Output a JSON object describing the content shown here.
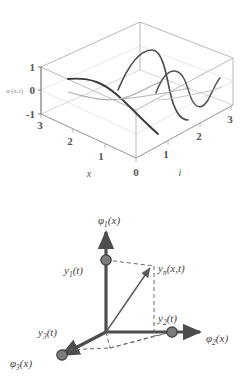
{
  "figure_top": {
    "name": "mode-shape-3d-plot",
    "axes": {
      "vertical": {
        "label": "φᵢ(x,t)",
        "ticks": [
          "1",
          "0",
          "-1"
        ],
        "values": [
          1,
          0,
          -1
        ]
      },
      "left_depth": {
        "label": "x",
        "ticks": [
          "3",
          "2",
          "1",
          "0"
        ],
        "values": [
          3,
          2,
          1,
          0
        ]
      },
      "right_depth": {
        "label": "i",
        "ticks": [
          "1",
          "2",
          "3"
        ],
        "values": [
          1,
          2,
          3
        ]
      }
    },
    "curves": [
      {
        "mode": 1,
        "i": 1,
        "half_waves": 1,
        "color": "#333333"
      },
      {
        "mode": 2,
        "i": 2,
        "half_waves": 2,
        "color": "#4a4a4a"
      },
      {
        "mode": 3,
        "i": 3,
        "half_waves": 3,
        "color": "#555555"
      }
    ],
    "box_color": "#9a9a9a"
  },
  "figure_bottom": {
    "name": "modal-basis-vector-diagram",
    "axis_labels": {
      "vertical": "φ",
      "vertical_sub": "1",
      "vertical_arg": "(x)",
      "right": "φ",
      "right_sub": "2",
      "right_arg": "(x)",
      "left": "φ",
      "left_sub": "3",
      "left_arg": "(x)"
    },
    "component_labels": {
      "y1": "y",
      "y1_sub": "1",
      "y1_arg": "(t)",
      "y2": "y",
      "y2_sub": "2",
      "y2_arg": "(t)",
      "y3": "y",
      "y3_sub": "3",
      "y3_arg": "(t)"
    },
    "resultant": {
      "symbol": "y",
      "sub": "n",
      "arg": "(x,t)"
    },
    "colors": {
      "axis": "#4d4d4d",
      "dot_fill": "#7d7d7d",
      "dot_stroke": "#3d3d3d",
      "dashed": "#6a6a6a",
      "resultant": "#5a5a5a"
    }
  }
}
